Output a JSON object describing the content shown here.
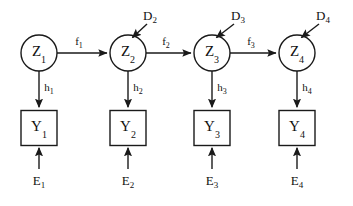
{
  "diagram": {
    "type": "directed-graph",
    "background_color": "#ffffff",
    "stroke_color": "#1a1a1a",
    "text_color": "#111111",
    "latent_nodes": [
      {
        "id": "Z1",
        "base": "Z",
        "sub": "1",
        "shape": "circle",
        "cx": 39,
        "cy": 53,
        "r": 18
      },
      {
        "id": "Z2",
        "base": "Z",
        "sub": "2",
        "shape": "circle",
        "cx": 128,
        "cy": 53,
        "r": 18
      },
      {
        "id": "Z3",
        "base": "Z",
        "sub": "3",
        "shape": "circle",
        "cx": 212,
        "cy": 53,
        "r": 18
      },
      {
        "id": "Z4",
        "base": "Z",
        "sub": "4",
        "shape": "circle",
        "cx": 297,
        "cy": 53,
        "r": 18
      }
    ],
    "observed_nodes": [
      {
        "id": "Y1",
        "base": "Y",
        "sub": "1",
        "shape": "square",
        "cx": 39,
        "cy": 128,
        "w": 36,
        "h": 35
      },
      {
        "id": "Y2",
        "base": "Y",
        "sub": "2",
        "shape": "square",
        "cx": 128,
        "cy": 128,
        "w": 36,
        "h": 35
      },
      {
        "id": "Y3",
        "base": "Y",
        "sub": "3",
        "shape": "square",
        "cx": 212,
        "cy": 128,
        "w": 36,
        "h": 35
      },
      {
        "id": "Y4",
        "base": "Y",
        "sub": "4",
        "shape": "square",
        "cx": 297,
        "cy": 128,
        "w": 36,
        "h": 35
      }
    ],
    "transition_labels": [
      {
        "id": "f1",
        "base": "f",
        "sub": "1",
        "x": 79,
        "y": 40,
        "from": "Z1",
        "to": "Z2"
      },
      {
        "id": "f2",
        "base": "f",
        "sub": "2",
        "x": 166,
        "y": 40,
        "from": "Z2",
        "to": "Z3"
      },
      {
        "id": "f3",
        "base": "f",
        "sub": "3",
        "x": 251,
        "y": 40,
        "from": "Z3",
        "to": "Z4"
      }
    ],
    "emission_labels": [
      {
        "id": "h1",
        "base": "h",
        "sub": "1",
        "x": 49,
        "y": 86,
        "from": "Z1",
        "to": "Y1"
      },
      {
        "id": "h2",
        "base": "h",
        "sub": "2",
        "x": 138,
        "y": 86,
        "from": "Z2",
        "to": "Y2"
      },
      {
        "id": "h3",
        "base": "h",
        "sub": "3",
        "x": 222,
        "y": 86,
        "from": "Z3",
        "to": "Y3"
      },
      {
        "id": "h4",
        "base": "h",
        "sub": "4",
        "x": 307,
        "y": 86,
        "from": "Z4",
        "to": "Y4"
      }
    ],
    "disturbance_inputs": [
      {
        "id": "D2",
        "base": "D",
        "sub": "2",
        "x": 150,
        "y": 15,
        "target": "Z2"
      },
      {
        "id": "D3",
        "base": "D",
        "sub": "3",
        "x": 238,
        "y": 15,
        "target": "Z3"
      },
      {
        "id": "D4",
        "base": "D",
        "sub": "4",
        "x": 323,
        "y": 15,
        "target": "Z4"
      }
    ],
    "noise_inputs": [
      {
        "id": "E1",
        "base": "E",
        "sub": "1",
        "x": 39,
        "y": 180,
        "target": "Y1"
      },
      {
        "id": "E2",
        "base": "E",
        "sub": "2",
        "x": 128,
        "y": 180,
        "target": "Y2"
      },
      {
        "id": "E3",
        "base": "E",
        "sub": "3",
        "x": 212,
        "y": 180,
        "target": "Y3"
      },
      {
        "id": "E4",
        "base": "E",
        "sub": "4",
        "x": 297,
        "y": 180,
        "target": "Y4"
      }
    ]
  }
}
